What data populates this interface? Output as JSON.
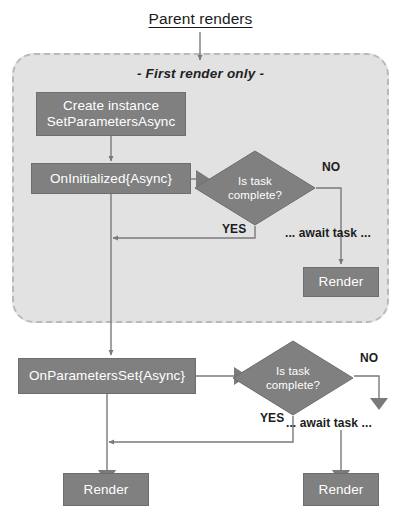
{
  "diagram": {
    "title": "Parent renders",
    "region_label": "- First render only -",
    "nodes": {
      "create_instance": "Create instance\nSetParametersAsync",
      "on_initialized": "OnInitialized{Async}",
      "render_first": "Render",
      "on_parameters_set": "OnParametersSet{Async}",
      "render_left": "Render",
      "render_right": "Render"
    },
    "decisions": {
      "first": {
        "line1": "Is task",
        "line2": "complete?"
      },
      "second": {
        "line1": "Is task",
        "line2": "complete?"
      }
    },
    "edge_labels": {
      "no_first": "NO",
      "yes_first": "YES",
      "await_first": "... await task ...",
      "no_second": "NO",
      "yes_second": "YES",
      "await_second": "... await task ..."
    },
    "colors": {
      "node_fill": "#808080",
      "node_text": "#ffffff",
      "region_fill": "#e2e2e2",
      "region_border": "#b9b9b9",
      "connector": "#7a7a7a",
      "page_background": "#ffffff",
      "title_text": "#1a1a1a"
    }
  }
}
